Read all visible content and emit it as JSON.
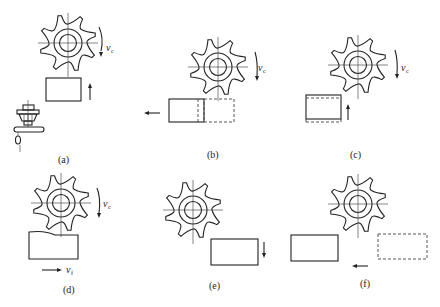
{
  "figure": {
    "panels": [
      {
        "id": "a",
        "label": "(a)",
        "cutter_speed": "v",
        "cutter_speed_sub": "c",
        "workpiece_motion": "up",
        "shows_machine_icon": true
      },
      {
        "id": "b",
        "label": "(b)",
        "cutter_speed": "v",
        "cutter_speed_sub": "c",
        "workpiece_motion": "left",
        "ghost_position": "right"
      },
      {
        "id": "c",
        "label": "(c)",
        "cutter_speed": "v",
        "cutter_speed_sub": "c",
        "workpiece_motion": "up",
        "ghost_position": "top-bottom"
      },
      {
        "id": "d",
        "label": "(d)",
        "cutter_speed": "v",
        "cutter_speed_sub": "c",
        "feed_speed": "v",
        "feed_speed_sub": "f",
        "workpiece_motion": "right"
      },
      {
        "id": "e",
        "label": "(e)",
        "workpiece_motion": "down"
      },
      {
        "id": "f",
        "label": "(f)",
        "workpiece_motion": "left",
        "ghost_position": "right"
      }
    ]
  },
  "colors": {
    "line": "#222222",
    "background": "#ffffff"
  }
}
